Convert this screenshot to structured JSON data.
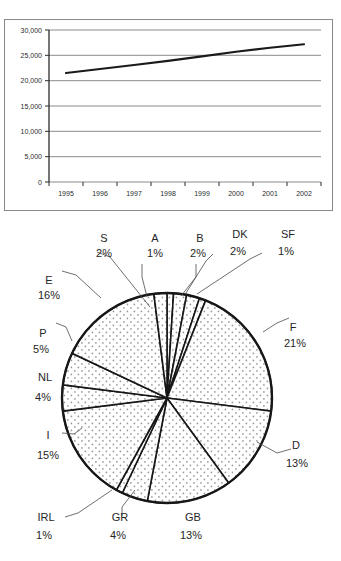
{
  "chart_data": [
    {
      "type": "line",
      "title": "",
      "xlabel": "",
      "ylabel": "",
      "grid": true,
      "legend": "none",
      "x": [
        "1995",
        "1996",
        "1997",
        "1998",
        "1999",
        "2000",
        "2001",
        "2002"
      ],
      "xtick_labels": [
        "1995",
        "1996",
        "1997",
        "1998",
        "1999",
        "2000",
        "2001",
        "2002"
      ],
      "ytick_labels": [
        "30,000",
        "25,000",
        "20,000",
        "15,000",
        "10,000",
        "5,000",
        "0"
      ],
      "ytick_values": [
        30000,
        25000,
        20000,
        15000,
        10000,
        5000,
        0
      ],
      "ylim": [
        0,
        30000
      ],
      "series": [
        {
          "name": "value",
          "values": [
            21500,
            22300,
            23100,
            23900,
            24800,
            25700,
            26500,
            27200
          ]
        }
      ]
    },
    {
      "type": "pie",
      "title": "",
      "legend": "labels-outside",
      "labels": [
        "F",
        "E",
        "I",
        "D",
        "GB",
        "P",
        "GR",
        "NL",
        "S",
        "B",
        "DK",
        "A",
        "IRL",
        "SF"
      ],
      "values": [
        21,
        16,
        15,
        13,
        13,
        5,
        4,
        4,
        2,
        2,
        2,
        1,
        1,
        1
      ],
      "label_suffix": "%",
      "slices": [
        {
          "name": "A",
          "pct": "1%",
          "value": 1
        },
        {
          "name": "B",
          "pct": "2%",
          "value": 2
        },
        {
          "name": "DK",
          "pct": "2%",
          "value": 2
        },
        {
          "name": "SF",
          "pct": "1%",
          "value": 1
        },
        {
          "name": "F",
          "pct": "21%",
          "value": 21
        },
        {
          "name": "D",
          "pct": "13%",
          "value": 13
        },
        {
          "name": "GB",
          "pct": "13%",
          "value": 13
        },
        {
          "name": "GR",
          "pct": "4%",
          "value": 4
        },
        {
          "name": "IRL",
          "pct": "1%",
          "value": 1
        },
        {
          "name": "I",
          "pct": "15%",
          "value": 15
        },
        {
          "name": "NL",
          "pct": "4%",
          "value": 4
        },
        {
          "name": "P",
          "pct": "5%",
          "value": 5
        },
        {
          "name": "E",
          "pct": "16%",
          "value": 16
        },
        {
          "name": "S",
          "pct": "2%",
          "value": 2
        }
      ]
    }
  ],
  "line_chart": {
    "ytick_0": "30,000",
    "ytick_1": "25,000",
    "ytick_2": "20,000",
    "ytick_3": "15,000",
    "ytick_4": "10,000",
    "ytick_5": "5,000",
    "ytick_6": "0",
    "xtick_0": "1995",
    "xtick_1": "1996",
    "xtick_2": "1997",
    "xtick_3": "1998",
    "xtick_4": "1999",
    "xtick_5": "2000",
    "xtick_6": "2001",
    "xtick_7": "2002"
  },
  "pie_chart": {
    "label_S_name": "S",
    "label_S_pct": "2%",
    "label_A_name": "A",
    "label_A_pct": "1%",
    "label_B_name": "B",
    "label_B_pct": "2%",
    "label_DK_name": "DK",
    "label_DK_pct": "2%",
    "label_SF_name": "SF",
    "label_SF_pct": "1%",
    "label_E_name": "E",
    "label_E_pct": "16%",
    "label_F_name": "F",
    "label_F_pct": "21%",
    "label_P_name": "P",
    "label_P_pct": "5%",
    "label_NL_name": "NL",
    "label_NL_pct": "4%",
    "label_I_name": "I",
    "label_I_pct": "15%",
    "label_D_name": "D",
    "label_D_pct": "13%",
    "label_IRL_name": "IRL",
    "label_IRL_pct": "1%",
    "label_GR_name": "GR",
    "label_GR_pct": "4%",
    "label_GB_name": "GB",
    "label_GB_pct": "13%"
  },
  "colors": {
    "line": "#1a1a1a",
    "grid": "#7d7d7d",
    "axis": "#3a3a3a",
    "border": "#8a8a8a",
    "pie_fill": "#f4f4f4",
    "pie_stroke": "#171717",
    "dot": "#9a9a9a"
  }
}
